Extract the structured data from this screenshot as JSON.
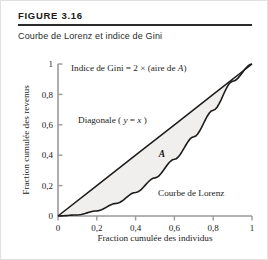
{
  "figure": {
    "label": "FIGURE 3.16",
    "caption": "Courbe de Lorenz et indice de Gini"
  },
  "chart_data": {
    "type": "line",
    "title": "Courbe de Lorenz et indice de Gini",
    "xlabel": "Fraction cumulée des individus",
    "ylabel": "Fraction cumulée des revenus",
    "xlim": [
      0,
      1
    ],
    "ylim": [
      0,
      1
    ],
    "grid": false,
    "legend": "none",
    "xticks": [
      "0",
      "0,2",
      "0,4",
      "0,6",
      "0,8",
      "1"
    ],
    "xtick_values": [
      0,
      0.2,
      0.4,
      0.6,
      0.8,
      1
    ],
    "yticks": [
      "0",
      "0,2",
      "0,4",
      "0,6",
      "0,8",
      "1"
    ],
    "ytick_values": [
      0,
      0.2,
      0.4,
      0.6,
      0.8,
      1
    ],
    "series": [
      {
        "name": "Diagonale (y = x)",
        "x": [
          0,
          0.2,
          0.4,
          0.6,
          0.8,
          1
        ],
        "values": [
          0,
          0.2,
          0.4,
          0.6,
          0.8,
          1
        ]
      },
      {
        "name": "Courbe de Lorenz",
        "x": [
          0,
          0.1,
          0.2,
          0.3,
          0.4,
          0.5,
          0.6,
          0.7,
          0.8,
          0.9,
          1
        ],
        "values": [
          0,
          0.007,
          0.034,
          0.083,
          0.155,
          0.251,
          0.373,
          0.521,
          0.696,
          0.886,
          1
        ]
      }
    ],
    "shaded_region": {
      "label": "A",
      "between": [
        "Diagonale (y = x)",
        "Courbe de Lorenz"
      ],
      "color": "#f1efed"
    },
    "annotations": [
      {
        "name": "gini-formula",
        "text_parts": [
          "Indice de Gini  =  2 × (aire de ",
          "A",
          ")"
        ],
        "x": 0.08,
        "y": 0.92
      },
      {
        "name": "diagonal-label",
        "text_parts": [
          "Diagonale ( ",
          "y",
          " = ",
          "x",
          " )"
        ],
        "x": 0.12,
        "y": 0.66
      },
      {
        "name": "lorenz-label",
        "text_parts": [
          "Courbe de Lorenz"
        ],
        "x": 0.55,
        "y": 0.21
      },
      {
        "name": "area-a-label",
        "text_parts": [
          "A"
        ],
        "x": 0.55,
        "y": 0.44
      }
    ],
    "colors": {
      "axis": "#9a9a9a",
      "curve": "#1b1b1b",
      "fill": "#f1efed",
      "text": "#232323"
    }
  }
}
